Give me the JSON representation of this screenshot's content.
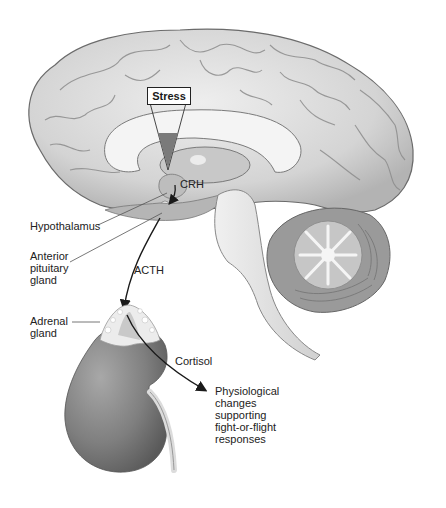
{
  "diagram": {
    "colors": {
      "background": "#ffffff",
      "brain_fill": "#d9d9d9",
      "brain_dark": "#a6a6a6",
      "corpus_callosum": "#f2f2f2",
      "kidney_fill": "#8c8c8c",
      "adrenal_fill": "#e6e6e6",
      "arrow": "#1a1a1a",
      "leader_line": "#555555",
      "stress_wedge": "#7a7a7a"
    },
    "labels": {
      "stress": "Stress",
      "crh": "CRH",
      "hypothalamus": "Hypothalamus",
      "anterior_pituitary": [
        "Anterior",
        "pituitary",
        "gland"
      ],
      "acth": "ACTH",
      "adrenal": [
        "Adrenal",
        "gland"
      ],
      "cortisol": "Cortisol",
      "outcome": [
        "Physiological",
        "changes",
        "supporting",
        "fight-or-flight",
        "responses"
      ]
    },
    "structures": [
      "cerebrum",
      "corpus-callosum",
      "thalamus",
      "hypothalamus",
      "pituitary",
      "brainstem",
      "cerebellum",
      "adrenal-gland",
      "kidney"
    ],
    "flow": [
      {
        "from": "Stress",
        "to": "Hypothalamus",
        "via": "wedge-arrow"
      },
      {
        "from": "Hypothalamus",
        "to": "Anterior pituitary gland",
        "signal": "CRH"
      },
      {
        "from": "Anterior pituitary gland",
        "to": "Adrenal gland",
        "signal": "ACTH"
      },
      {
        "from": "Adrenal gland",
        "to": "Physiological changes supporting fight-or-flight responses",
        "signal": "Cortisol"
      }
    ]
  }
}
